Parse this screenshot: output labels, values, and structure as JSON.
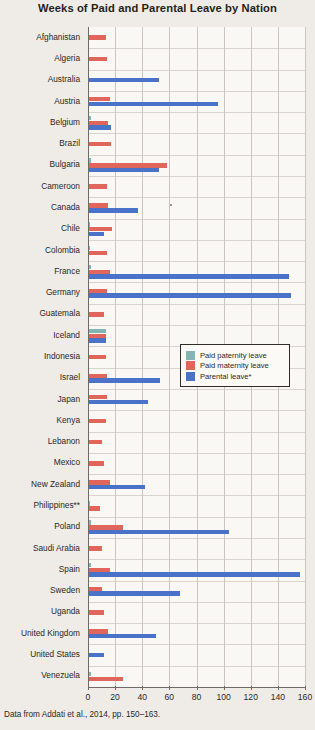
{
  "chart_data": {
    "type": "bar",
    "orientation": "horizontal",
    "title": "Weeks of Paid and Parental Leave by Nation",
    "xlabel": "",
    "ylabel": "",
    "xlim": [
      0,
      160
    ],
    "xticks": [
      0,
      20,
      40,
      60,
      80,
      100,
      120,
      140,
      160
    ],
    "grid": true,
    "legend_position": "center-right-inside",
    "caption": "Data from Addati et al., 2014, pp. 150–163.",
    "series": [
      {
        "name": "Paid paternity leave",
        "color": "#83b5b2",
        "key": "paternity"
      },
      {
        "name": "Paid maternity leave",
        "color": "#e0655b",
        "key": "maternity"
      },
      {
        "name": "Parental leave*",
        "color": "#4a72c8",
        "key": "parental"
      }
    ],
    "categories": [
      "Afghanistan",
      "Algeria",
      "Australia",
      "Austria",
      "Belgium",
      "Brazil",
      "Bulgaria",
      "Cameroon",
      "Canada",
      "Chile",
      "Colombia",
      "France",
      "Germany",
      "Guatemala",
      "Iceland",
      "Indonesia",
      "Israel",
      "Japan",
      "Kenya",
      "Lebanon",
      "Mexico",
      "New Zealand",
      "Philippines**",
      "Poland",
      "Saudi Arabia",
      "Spain",
      "Sweden",
      "Uganda",
      "United Kingdom",
      "United States",
      "Venezuela"
    ],
    "rows": [
      {
        "country": "Afghanistan",
        "paternity": 0,
        "maternity": 13,
        "parental": 0
      },
      {
        "country": "Algeria",
        "paternity": 0,
        "maternity": 14,
        "parental": 0
      },
      {
        "country": "Australia",
        "paternity": 0,
        "maternity": 0,
        "parental": 52
      },
      {
        "country": "Austria",
        "paternity": 0,
        "maternity": 16,
        "parental": 96
      },
      {
        "country": "Belgium",
        "paternity": 2,
        "maternity": 15,
        "parental": 17
      },
      {
        "country": "Brazil",
        "paternity": 0,
        "maternity": 17,
        "parental": 0
      },
      {
        "country": "Bulgaria",
        "paternity": 2,
        "maternity": 58,
        "parental": 52
      },
      {
        "country": "Cameroon",
        "paternity": 0,
        "maternity": 14,
        "parental": 0
      },
      {
        "country": "Canada",
        "paternity": 0,
        "maternity": 15,
        "parental": 37
      },
      {
        "country": "Chile",
        "paternity": 1,
        "maternity": 18,
        "parental": 12
      },
      {
        "country": "Colombia",
        "paternity": 1,
        "maternity": 14,
        "parental": 0
      },
      {
        "country": "France",
        "paternity": 2,
        "maternity": 16,
        "parental": 148
      },
      {
        "country": "Germany",
        "paternity": 0,
        "maternity": 14,
        "parental": 150
      },
      {
        "country": "Guatemala",
        "paternity": 0,
        "maternity": 12,
        "parental": 0
      },
      {
        "country": "Iceland",
        "paternity": 13,
        "maternity": 13,
        "parental": 13
      },
      {
        "country": "Indonesia",
        "paternity": 0,
        "maternity": 13,
        "parental": 0
      },
      {
        "country": "Israel",
        "paternity": 0,
        "maternity": 14,
        "parental": 53
      },
      {
        "country": "Japan",
        "paternity": 0,
        "maternity": 14,
        "parental": 44
      },
      {
        "country": "Kenya",
        "paternity": 0,
        "maternity": 13,
        "parental": 0
      },
      {
        "country": "Lebanon",
        "paternity": 0,
        "maternity": 10,
        "parental": 0
      },
      {
        "country": "Mexico",
        "paternity": 0,
        "maternity": 12,
        "parental": 0
      },
      {
        "country": "New Zealand",
        "paternity": 0,
        "maternity": 16,
        "parental": 42
      },
      {
        "country": "Philippines**",
        "paternity": 1,
        "maternity": 9,
        "parental": 0
      },
      {
        "country": "Poland",
        "paternity": 2,
        "maternity": 26,
        "parental": 104
      },
      {
        "country": "Saudi Arabia",
        "paternity": 0,
        "maternity": 10,
        "parental": 0
      },
      {
        "country": "Spain",
        "paternity": 2,
        "maternity": 16,
        "parental": 156
      },
      {
        "country": "Sweden",
        "paternity": 0,
        "maternity": 10,
        "parental": 68
      },
      {
        "country": "Uganda",
        "paternity": 0,
        "maternity": 12,
        "parental": 0
      },
      {
        "country": "United Kingdom",
        "paternity": 0,
        "maternity": 15,
        "parental": 50
      },
      {
        "country": "United States",
        "paternity": 0,
        "maternity": 0,
        "parental": 12
      },
      {
        "country": "Venezuela",
        "paternity": 2,
        "maternity": 26,
        "parental": 0
      }
    ]
  },
  "legend": {
    "items": [
      {
        "label": "Paid paternity leave",
        "key": "paternity"
      },
      {
        "label": "Paid maternity leave",
        "key": "maternity"
      },
      {
        "label": "Parental leave*",
        "key": "parental"
      }
    ]
  },
  "colors": {
    "paternity": "#83b5b2",
    "maternity": "#e0655b",
    "parental": "#4a72c8",
    "background": "#efece7",
    "plot_background": "#faf8f4",
    "axis": "#6e6b66",
    "grid": "#c9c6c0",
    "text": "#231f20"
  }
}
